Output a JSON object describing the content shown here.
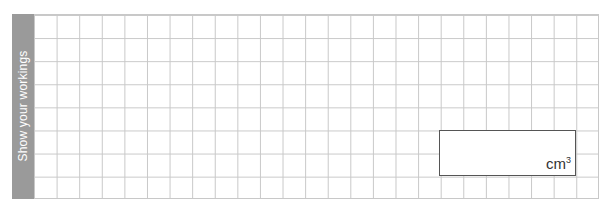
{
  "workings": {
    "sidebar_label": "Show your workings",
    "grid": {
      "columns": 25,
      "rows": 8,
      "line_color": "#c8c8c8"
    },
    "sidebar_color": "#9a9a9a"
  },
  "answer": {
    "value": "",
    "unit": "cm",
    "unit_exponent": "3"
  }
}
